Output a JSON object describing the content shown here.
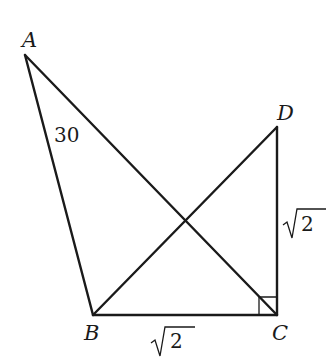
{
  "figure": {
    "type": "geometry-diagram",
    "points": {
      "A": {
        "label": "A",
        "x": 25,
        "y": 55
      },
      "B": {
        "label": "B",
        "x": 93,
        "y": 315
      },
      "C": {
        "label": "C",
        "x": 277,
        "y": 315
      },
      "D": {
        "label": "D",
        "x": 277,
        "y": 127
      }
    },
    "segments": [
      "AB",
      "AC",
      "BC",
      "BD",
      "CD"
    ],
    "right_angle_at": "C",
    "annotations": {
      "angle_A": "30",
      "side_BC": "2",
      "side_CD": "2",
      "radical": "√"
    }
  }
}
